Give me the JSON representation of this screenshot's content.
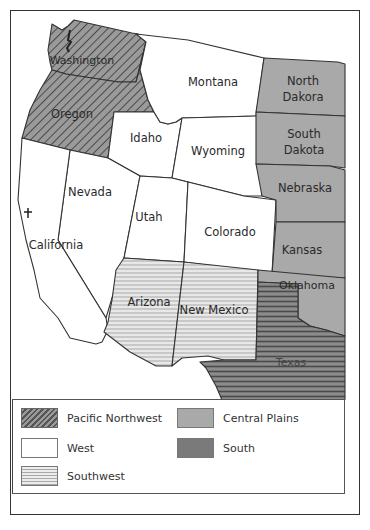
{
  "map": {
    "states": [
      {
        "name": "Washington",
        "region": "pacific_northwest"
      },
      {
        "name": "Oregon",
        "region": "pacific_northwest"
      },
      {
        "name": "Idaho",
        "region": "west"
      },
      {
        "name": "Montana",
        "region": "west"
      },
      {
        "name": "Wyoming",
        "region": "west"
      },
      {
        "name": "Nevada",
        "region": "west"
      },
      {
        "name": "California",
        "region": "west"
      },
      {
        "name": "Utah",
        "region": "west"
      },
      {
        "name": "Colorado",
        "region": "west"
      },
      {
        "name": "Arizona",
        "region": "southwest"
      },
      {
        "name": "New Mexico",
        "region": "southwest"
      },
      {
        "name": "North Dakora",
        "label_lines": [
          "North",
          "Dakora"
        ],
        "region": "central_plains"
      },
      {
        "name": "South Dakota",
        "label_lines": [
          "South",
          "Dakota"
        ],
        "region": "central_plains"
      },
      {
        "name": "Nebraska",
        "region": "central_plains"
      },
      {
        "name": "Kansas",
        "region": "central_plains"
      },
      {
        "name": "Oklahoma",
        "region": "central_plains"
      },
      {
        "name": "Texas",
        "region": "south"
      }
    ],
    "labels": {
      "washington": "Washington",
      "oregon": "Oregon",
      "idaho": "Idaho",
      "montana": "Montana",
      "wyoming": "Wyoming",
      "nevada": "Nevada",
      "california": "California",
      "utah": "Utah",
      "colorado": "Colorado",
      "arizona": "Arizona",
      "new_mexico": "New Mexico",
      "north_dakota_1": "North",
      "north_dakota_2": "Dakora",
      "south_dakota_1": "South",
      "south_dakota_2": "Dakota",
      "nebraska": "Nebraska",
      "kansas": "Kansas",
      "oklahoma": "Oklahoma",
      "texas": "Texas"
    }
  },
  "legend": {
    "items": [
      {
        "key": "pacific_northwest",
        "label": "Pacific Northwest",
        "pattern": "diagonal-hatch",
        "color": "#8a8a8a"
      },
      {
        "key": "west",
        "label": "West",
        "pattern": "solid",
        "color": "#ffffff"
      },
      {
        "key": "southwest",
        "label": "Southwest",
        "pattern": "horizontal-lines-light",
        "color": "#d4d4d4"
      },
      {
        "key": "central_plains",
        "label": "Central Plains",
        "pattern": "solid",
        "color": "#a9a9a9"
      },
      {
        "key": "south",
        "label": "South",
        "pattern": "horizontal-lines-dark",
        "color": "#777777"
      }
    ]
  }
}
